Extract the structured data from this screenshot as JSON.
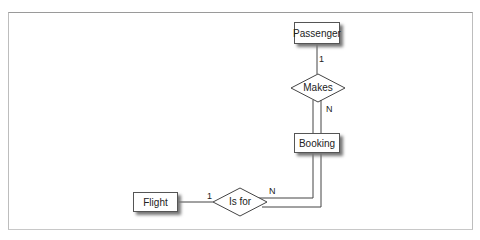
{
  "diagram": {
    "type": "entity-relationship",
    "entities": [
      {
        "id": "passenger",
        "label": "Passenger"
      },
      {
        "id": "booking",
        "label": "Booking"
      },
      {
        "id": "flight",
        "label": "Flight"
      }
    ],
    "relationships": [
      {
        "id": "makes",
        "label": "Makes",
        "from": "passenger",
        "to": "booking",
        "from_cardinality": "1",
        "to_cardinality": "N"
      },
      {
        "id": "is_for",
        "label": "Is for",
        "from": "flight",
        "to": "booking",
        "from_cardinality": "1",
        "to_cardinality": "N"
      }
    ],
    "colors": {
      "line": "#444444",
      "border": "#555555",
      "shadow": "#777777",
      "frame": "#bdbdbd"
    }
  }
}
